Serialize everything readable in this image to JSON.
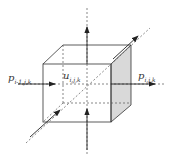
{
  "diagram": {
    "labels": {
      "p_left": {
        "base": "p",
        "sub": "i-1,j,k"
      },
      "u_center": {
        "base": "u",
        "sub": "i,j,k"
      },
      "p_right": {
        "base": "p",
        "sub": "i,j,k"
      }
    },
    "colors": {
      "line": "#333333",
      "shade": "#d9d9d9",
      "background": "#ffffff"
    }
  }
}
